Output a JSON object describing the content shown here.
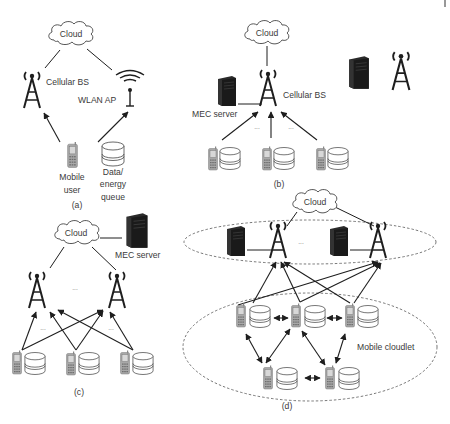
{
  "figure": {
    "panels": [
      {
        "id": "a",
        "caption": "(a)",
        "labels": {
          "cloud": "Cloud",
          "cellular_bs": "Cellular BS",
          "wlan_ap": "WLAN AP",
          "mobile_user_line1": "Mobile",
          "mobile_user_line2": "user",
          "queue_line1": "Data/",
          "queue_line2": "energy",
          "queue_line3": "queue"
        }
      },
      {
        "id": "b",
        "caption": "(b)",
        "labels": {
          "cloud": "Cloud",
          "cellular_bs": "Cellular BS",
          "mec_server": "MEC server",
          "ellipsis": "···"
        }
      },
      {
        "id": "c",
        "caption": "(c)",
        "labels": {
          "cloud": "Cloud",
          "mec_server": "MEC server",
          "ellipsis": "···"
        }
      },
      {
        "id": "d",
        "caption": "(d)",
        "labels": {
          "cloud": "Cloud",
          "mobile_cloudlet": "Mobile cloudlet",
          "ellipsis": "···"
        }
      }
    ],
    "legend_icons": [
      "mec-server-icon",
      "cellular-tower-icon"
    ],
    "colors": {
      "line": "#1e1e1e",
      "text": "#3a3a3a",
      "server": "#222222",
      "phone": "#9a9a9a",
      "dashed": "#555555"
    }
  }
}
